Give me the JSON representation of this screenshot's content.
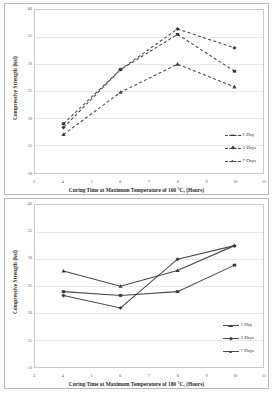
{
  "figures": [
    {
      "id": "chart-160c",
      "axis_title_y": "Compressive Strength (ksi)",
      "axis_title_x": "Curing Time at Maximum Temperature of 160 °C, (Hours)",
      "y_ticks": [
        "40",
        "35",
        "30",
        "25",
        "20",
        "15",
        "10"
      ],
      "x_ticks": [
        "3",
        "4",
        "5",
        "6",
        "7",
        "8",
        "9",
        "10",
        "11"
      ],
      "legend": [
        {
          "label": "1 Day",
          "marker": "▬",
          "style": "dashed"
        },
        {
          "label": "3 Days",
          "marker": "◆",
          "style": "dashed"
        },
        {
          "label": "7 Days",
          "marker": "▲",
          "style": "dashed"
        }
      ]
    },
    {
      "id": "chart-180c",
      "axis_title_y": "Compressive Strength (ksi)",
      "axis_title_x": "Curing Time at Maximum Temperature of 180 °C, (Hours)",
      "y_ticks": [
        "40",
        "35",
        "30",
        "25",
        "20",
        "15",
        "10"
      ],
      "x_ticks": [
        "3",
        "4",
        "5",
        "6",
        "7",
        "8",
        "9",
        "10",
        "11"
      ],
      "legend": [
        {
          "label": "1 Day",
          "marker": "▬",
          "style": "solid"
        },
        {
          "label": "3 Days",
          "marker": "◆",
          "style": "solid"
        },
        {
          "label": "7 Days",
          "marker": "▲",
          "style": "solid"
        }
      ]
    }
  ],
  "chart_data": [
    {
      "type": "line",
      "title": "",
      "xlabel": "Curing Time at Maximum Temperature of 160 °C, (Hours)",
      "ylabel": "Compressive Strength (ksi)",
      "xlim": [
        3,
        11
      ],
      "ylim": [
        10,
        40
      ],
      "xticks": [
        3,
        4,
        5,
        6,
        7,
        8,
        9,
        10,
        11
      ],
      "yticks": [
        10,
        15,
        20,
        25,
        30,
        35,
        40
      ],
      "grid": true,
      "legend_position": "inside-lower-right",
      "linestyle": "dashed",
      "x": [
        4,
        6,
        8,
        10
      ],
      "series": [
        {
          "name": "1 Day",
          "values": [
            19.0,
            29.0,
            35.5,
            28.7
          ]
        },
        {
          "name": "3 Days",
          "values": [
            18.3,
            29.0,
            36.5,
            33.0
          ]
        },
        {
          "name": "7 Days",
          "values": [
            17.0,
            24.8,
            30.0,
            25.8
          ]
        }
      ]
    },
    {
      "type": "line",
      "title": "",
      "xlabel": "Curing Time at Maximum Temperature of 180 °C, (Hours)",
      "ylabel": "Compressive Strength (ksi)",
      "xlim": [
        3,
        11
      ],
      "ylim": [
        10,
        40
      ],
      "xticks": [
        3,
        4,
        5,
        6,
        7,
        8,
        9,
        10,
        11
      ],
      "yticks": [
        10,
        15,
        20,
        25,
        30,
        35,
        40
      ],
      "grid": true,
      "legend_position": "inside-lower-right",
      "linestyle": "solid",
      "x": [
        4,
        6,
        8,
        10
      ],
      "series": [
        {
          "name": "1 Day",
          "values": [
            24.0,
            23.3,
            24.0,
            28.9
          ]
        },
        {
          "name": "3 Days",
          "values": [
            23.3,
            21.0,
            30.0,
            32.5
          ]
        },
        {
          "name": "7 Days",
          "values": [
            27.8,
            25.0,
            27.9,
            32.5
          ]
        }
      ]
    }
  ]
}
